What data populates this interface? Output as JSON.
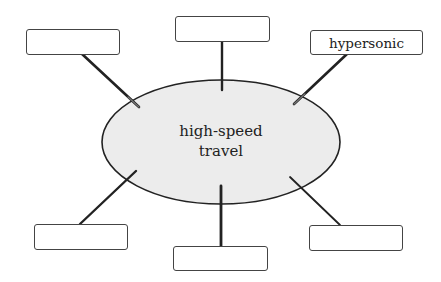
{
  "diagram": {
    "type": "concept-web",
    "center": {
      "line1": "high-speed",
      "line2": "travel",
      "fill": "#ececec",
      "stroke": "#222222"
    },
    "nodes": [
      {
        "id": "top-left",
        "label": ""
      },
      {
        "id": "top-center",
        "label": ""
      },
      {
        "id": "top-right",
        "label": "hypersonic"
      },
      {
        "id": "bottom-left",
        "label": ""
      },
      {
        "id": "bottom-center",
        "label": ""
      },
      {
        "id": "bottom-right",
        "label": ""
      }
    ]
  }
}
